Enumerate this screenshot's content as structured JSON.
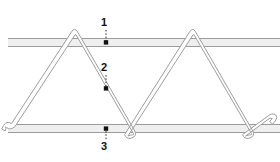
{
  "diagram": {
    "colors": {
      "bar_fill": "#efefef",
      "bar_stroke": "#9a9a9a",
      "wire_stroke": "#9e9e9e",
      "wire_fill": "#ffffff",
      "leader_line": "#2b2b2b",
      "callout_dot": "#111111",
      "label_text": "#111111",
      "background": "#ffffff"
    },
    "callouts": [
      {
        "id": "callout-1",
        "label": "1",
        "target": "top-chord-bar",
        "label_x": 104,
        "label_y": 23,
        "dot_x": 106,
        "dot_y": 42,
        "leader_style": "dotted"
      },
      {
        "id": "callout-2",
        "label": "2",
        "target": "diagonal-zigzag-wire",
        "label_x": 104,
        "label_y": 68,
        "dot_x": 106,
        "dot_y": 88,
        "leader_style": "dotted"
      },
      {
        "id": "callout-3",
        "label": "3",
        "target": "bottom-chord-bar",
        "label_x": 104,
        "label_y": 147,
        "dot_x": 106,
        "dot_y": 130,
        "leader_style": "dotted"
      }
    ],
    "top_bar": {
      "name": "top-chord-bar",
      "x": 8,
      "y": 38,
      "width": 272,
      "height": 9
    },
    "bottom_bar": {
      "name": "bottom-chord-bar",
      "x": 8,
      "y": 124,
      "width": 272,
      "height": 9
    },
    "wire": {
      "name": "diagonal-zigzag-wire",
      "peak_y": 33,
      "valley_y": 135,
      "peaks_x": [
        72,
        190
      ],
      "valleys_x": [
        10,
        131,
        249
      ],
      "stroke_width": 1,
      "band_width": 4
    }
  }
}
